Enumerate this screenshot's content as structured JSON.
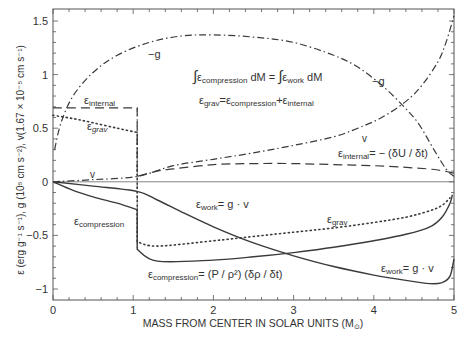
{
  "chart_data": {
    "type": "line",
    "title": "",
    "xlabel": "MASS FROM CENTER IN SOLAR UNITS (M⊙)",
    "ylabel": "ε (erg g⁻¹ s⁻¹), g (10⁵ cm s⁻²), v(1.67×10⁻⁵ cm s⁻¹)",
    "xlim": [
      0,
      5
    ],
    "ylim": [
      -1.1,
      1.61
    ],
    "xticks": [
      "0",
      "1",
      "2",
      "3",
      "4",
      "5"
    ],
    "yticks": [
      "1.5",
      "1",
      "0.5",
      "0",
      "−0.5",
      "−1"
    ],
    "grid": false,
    "legend": "none (inline labels)",
    "series": [
      {
        "name": "−g",
        "style": "dashdot",
        "x": [
          0.02,
          0.1,
          0.25,
          0.5,
          0.8,
          1.2,
          1.6,
          2.0,
          2.5,
          3.0,
          3.5,
          3.8,
          4.1,
          4.35,
          4.55,
          4.75,
          4.9,
          5.0
        ],
        "y": [
          0.3,
          0.55,
          0.8,
          1.02,
          1.18,
          1.3,
          1.36,
          1.37,
          1.35,
          1.3,
          1.18,
          1.07,
          0.9,
          0.72,
          0.55,
          0.3,
          0.12,
          0.05
        ]
      },
      {
        "name": "v",
        "style": "dashdot",
        "x": [
          0,
          0.5,
          1.05,
          1.5,
          2.0,
          2.5,
          3.0,
          3.5,
          3.8,
          4.1,
          4.4,
          4.6,
          4.8,
          4.9,
          5.0
        ],
        "y": [
          0,
          0.02,
          0.05,
          0.15,
          0.21,
          0.27,
          0.34,
          0.42,
          0.5,
          0.6,
          0.75,
          0.9,
          1.12,
          1.3,
          1.55
        ]
      },
      {
        "name": "ε_internal",
        "style": "dashed",
        "x": [
          0,
          1.05,
          1.05,
          1.3,
          1.5,
          2.0,
          2.5,
          3.0,
          3.5,
          4.0,
          4.5,
          4.8,
          5.0
        ],
        "y": [
          0.69,
          0.69,
          0.05,
          0.1,
          0.12,
          0.16,
          0.17,
          0.17,
          0.16,
          0.15,
          0.13,
          0.11,
          0.08
        ]
      },
      {
        "name": "ε_grav",
        "style": "dotted",
        "x": [
          0,
          0.25,
          0.5,
          0.8,
          1.05,
          1.05,
          1.3,
          2.0,
          2.5,
          3.0,
          3.5,
          4.0,
          4.4,
          4.7,
          4.85,
          4.95
        ],
        "y": [
          0.62,
          0.59,
          0.55,
          0.5,
          0.46,
          -0.56,
          -0.6,
          -0.55,
          -0.51,
          -0.47,
          -0.43,
          -0.38,
          -0.33,
          -0.27,
          -0.22,
          -0.15
        ]
      },
      {
        "name": "ε_compression",
        "style": "solid",
        "x": [
          0,
          0.25,
          0.5,
          0.8,
          1.05,
          1.05,
          1.3,
          2.0,
          2.5,
          3.0,
          3.5,
          4.0,
          4.4,
          4.7,
          4.85,
          4.95,
          4.98
        ],
        "y": [
          0,
          -0.08,
          -0.14,
          -0.2,
          -0.26,
          -0.63,
          -0.74,
          -0.73,
          -0.7,
          -0.66,
          -0.61,
          -0.55,
          -0.49,
          -0.42,
          -0.33,
          -0.2,
          -0.12
        ]
      },
      {
        "name": "ε_work",
        "style": "solid",
        "x": [
          0,
          0.5,
          1.05,
          1.3,
          1.6,
          2.0,
          2.5,
          3.0,
          3.5,
          4.0,
          4.4,
          4.7,
          4.85,
          4.95,
          5.0
        ],
        "y": [
          0,
          -0.04,
          -0.09,
          -0.17,
          -0.28,
          -0.42,
          -0.57,
          -0.69,
          -0.79,
          -0.87,
          -0.92,
          -0.95,
          -0.94,
          -0.88,
          -0.72
        ]
      }
    ],
    "annotations": [
      {
        "text": "−g",
        "x": 1.18,
        "y": 1.17
      },
      {
        "text": "−g",
        "x": 3.9,
        "y": 0.93
      },
      {
        "text": "∫ε compression dM = ∫ε work dM",
        "x": 2.7,
        "y": 0.98
      },
      {
        "text": "εgrav = εcompression + εinternal",
        "x": 2.8,
        "y": 0.75
      },
      {
        "text": "εinternal",
        "x": 0.6,
        "y": 0.74
      },
      {
        "text": "εgrav",
        "x": 0.55,
        "y": 0.5
      },
      {
        "text": "v",
        "x": 0.22,
        "y": 0.04
      },
      {
        "text": "v",
        "x": 3.9,
        "y": 0.37
      },
      {
        "text": "εinternal = −(δU/δt)",
        "x": 3.45,
        "y": 0.2
      },
      {
        "text": "εcompression",
        "x": 0.55,
        "y": -0.38
      },
      {
        "text": "εwork = g · v",
        "x": 2.15,
        "y": -0.43
      },
      {
        "text": "εgrav",
        "x": 3.15,
        "y": -0.46
      },
      {
        "text": "εcompression = (P/ρ²)(δρ/δt)",
        "x": 1.95,
        "y": -0.85
      },
      {
        "text": "εwork = g · v",
        "x": 4.4,
        "y": -0.82
      }
    ]
  },
  "labels": {
    "xlabel_main": "MASS FROM CENTER IN SOLAR UNITS (M",
    "xlabel_sub": "⊙",
    "xlabel_close": ")",
    "ylabel": "ε (erg g⁻¹ s⁻¹), g (10⁵ cm s⁻²), v(1.67 × 10⁻⁵ cm s⁻¹)",
    "eps": "ε",
    "minus_g": "−g",
    "v": "v",
    "sub_internal": "internal",
    "sub_grav": "grav",
    "sub_compression": "compression",
    "sub_work": "work",
    "integral": "∫",
    "dM_eq": "dM =",
    "dM": "dM",
    "eq": "=",
    "plus": "+",
    "gv": "= g · v",
    "internal_rhs": "= − (δU / δt)",
    "compression_rhs": "= (P / ρ²) (δρ / δt)"
  },
  "colors": {
    "line": "#3a3a3a",
    "frame": "#555555",
    "text": "#333333"
  }
}
